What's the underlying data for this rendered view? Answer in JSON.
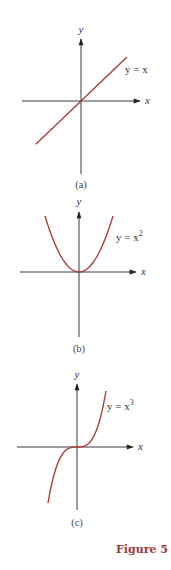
{
  "chart_data": [
    {
      "type": "line",
      "panel": "(a)",
      "function": "y = x",
      "equation_label": "y = x",
      "xlabel": "x",
      "ylabel": "y",
      "xlim": [
        -1,
        1
      ],
      "ylim": [
        -1,
        1
      ],
      "x": [
        -1,
        -0.5,
        0,
        0.5,
        1
      ],
      "series": [
        {
          "name": "y = x",
          "values": [
            -1,
            -0.5,
            0,
            0.5,
            1
          ]
        }
      ],
      "caption": "(a)",
      "curve_color": "#a8403c",
      "grid": false
    },
    {
      "type": "line",
      "panel": "(b)",
      "function": "y = x^2",
      "equation_label": "y = x",
      "equation_exponent": "2",
      "xlabel": "x",
      "ylabel": "y",
      "xlim": [
        -1,
        1
      ],
      "ylim": [
        -1,
        1
      ],
      "x": [
        -1,
        -0.5,
        0,
        0.5,
        1
      ],
      "series": [
        {
          "name": "y = x^2",
          "values": [
            1,
            0.25,
            0,
            0.25,
            1
          ]
        }
      ],
      "caption": "(b)",
      "curve_color": "#a8403c",
      "grid": false
    },
    {
      "type": "line",
      "panel": "(c)",
      "function": "y = x^3",
      "equation_label": "y = x",
      "equation_exponent": "3",
      "xlabel": "x",
      "ylabel": "y",
      "xlim": [
        -1,
        1
      ],
      "ylim": [
        -1,
        1
      ],
      "x": [
        -1,
        -0.5,
        0,
        0.5,
        1
      ],
      "series": [
        {
          "name": "y = x^3",
          "values": [
            -1,
            -0.125,
            0,
            0.125,
            1
          ]
        }
      ],
      "caption": "(c)",
      "curve_color": "#a8403c",
      "grid": false
    }
  ],
  "figure_label": "Figure 5",
  "colors": {
    "curve": "#a8403c",
    "axis": "#3a3a3a",
    "figure_label": "#9a3b36"
  }
}
